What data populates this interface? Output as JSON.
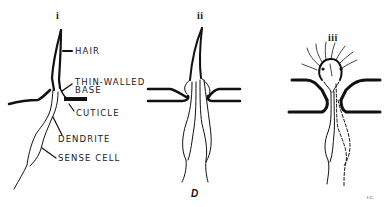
{
  "figure": {
    "label": "D",
    "signature": "J.C.",
    "panels": [
      {
        "numeral": "i",
        "description": "tactile hair with sense cell"
      },
      {
        "numeral": "ii",
        "description": "hair with paired sense cells"
      },
      {
        "numeral": "iii",
        "description": "dome sensillum with radiating lines"
      }
    ],
    "labels": {
      "hair": "HAIR",
      "thin_walled_line1": "THIN-WALLED",
      "thin_walled_line2": "BASE",
      "cuticle": "CUTICLE",
      "dendrite": "DENDRITE",
      "sense_cell": "SENSE CELL"
    },
    "colors": {
      "ink": "#111111",
      "paper": "#ffffff"
    }
  }
}
